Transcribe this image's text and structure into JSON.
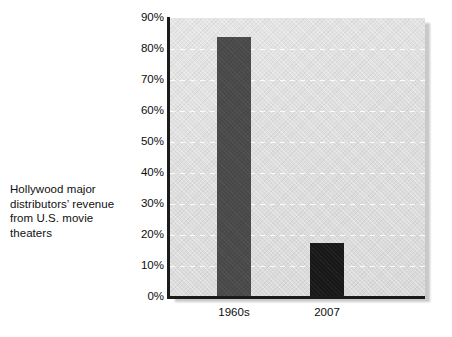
{
  "caption": {
    "text": "Hollywood major distributors’ revenue from U.S. movie theaters"
  },
  "chart_data": {
    "type": "bar",
    "title": "",
    "subtitle": "",
    "xlabel": "",
    "ylabel": "",
    "categories": [
      "1960s",
      "2007"
    ],
    "values": [
      84,
      17.5
    ],
    "value_labels": [
      "84%",
      "17.5%"
    ],
    "series": [
      {
        "name": "Hollywood major distributors’ revenue from U.S. movie theaters",
        "values": [
          84,
          17.5
        ]
      }
    ],
    "ylim": [
      0,
      90
    ],
    "ytick_values": [
      0,
      10,
      20,
      30,
      40,
      50,
      60,
      70,
      80,
      90
    ],
    "ytick_labels": [
      "0%",
      "10%",
      "20%",
      "30%",
      "40%",
      "50%",
      "60%",
      "70%",
      "80%",
      "90%"
    ],
    "grid": true,
    "grid_orientation": "horizontal",
    "grid_style": "dashed",
    "legend": false,
    "legend_position": "none",
    "bar_colors": [
      "#4a4a4a",
      "#181818"
    ],
    "plot_background": "#e0e0e0",
    "gridline_color": "#ffffff",
    "axis_color": "#1b1b1b",
    "text_color": "#0d0d0d",
    "page_background": "#ffffff"
  }
}
